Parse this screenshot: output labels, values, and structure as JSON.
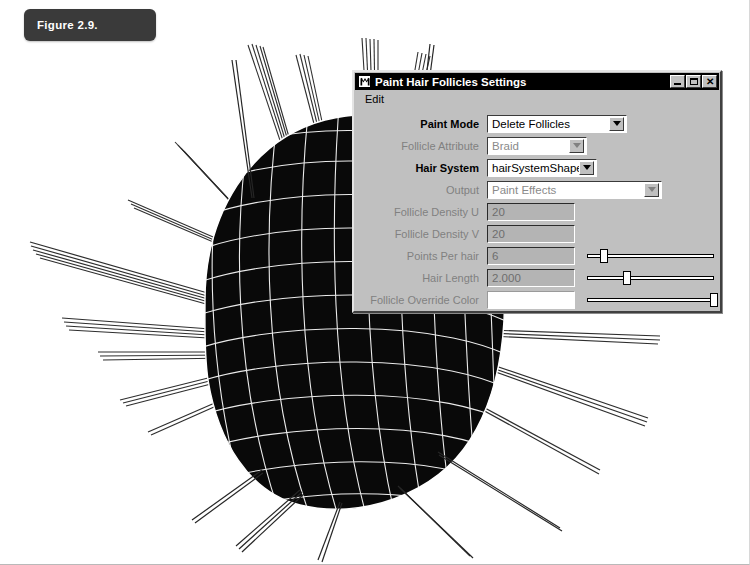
{
  "figure": {
    "caption": "Figure 2.9."
  },
  "dialog": {
    "icon": "maya-m-icon",
    "title": "Paint Hair Follicles Settings",
    "window_buttons": {
      "minimize": "minimize-icon",
      "maximize": "maximize-icon",
      "close": "close-icon"
    },
    "menu": [
      {
        "label": "Edit"
      }
    ],
    "fields": [
      {
        "label": "Paint Mode",
        "enabled": true,
        "control": "dropdown",
        "value": "Delete Follicles",
        "width": 140
      },
      {
        "label": "Follicle Attribute",
        "enabled": false,
        "control": "dropdown",
        "value": "Braid",
        "width": 100
      },
      {
        "label": "Hair System",
        "enabled": true,
        "control": "dropdown",
        "value": "hairSystemShape1",
        "width": 110
      },
      {
        "label": "Output",
        "enabled": false,
        "control": "dropdown",
        "value": "Paint Effects",
        "width": 175
      },
      {
        "label": "Follicle Density U",
        "enabled": false,
        "control": "textfield",
        "value": "20"
      },
      {
        "label": "Follicle Density V",
        "enabled": false,
        "control": "textfield",
        "value": "20"
      },
      {
        "label": "Points Per hair",
        "enabled": false,
        "control": "textfield-slider",
        "value": "6",
        "slider_percent": 10
      },
      {
        "label": "Hair Length",
        "enabled": false,
        "control": "textfield-slider",
        "value": "2.000",
        "slider_percent": 28
      },
      {
        "label": "Follicle Override Color",
        "enabled": false,
        "control": "colorswatch-slider",
        "value": "",
        "swatch_color": "#ffffff",
        "slider_percent": 97
      }
    ]
  },
  "viewport": {
    "description": "maya-3d-hair-viewport",
    "background_color": "#ffffff",
    "mesh_fill_color": "#0a0a0a",
    "wireframe_color": "#ffffff",
    "hair_color": "#2b2b2b"
  }
}
